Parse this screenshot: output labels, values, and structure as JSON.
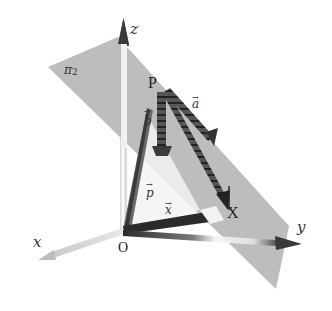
{
  "figure": {
    "type": "3d-vector-diagram",
    "axes": {
      "x": {
        "label": "x"
      },
      "y": {
        "label": "y"
      },
      "z": {
        "label": "z"
      }
    },
    "plane": {
      "label": "π",
      "subscript": "2",
      "color": "#b9b9b9"
    },
    "points": {
      "origin": {
        "label": "O"
      },
      "P": {
        "label": "P"
      },
      "X": {
        "label": "X"
      }
    },
    "vectors": {
      "a": {
        "label": "a",
        "arrow": "→",
        "style": "dashed-3d"
      },
      "b": {
        "label": "b",
        "arrow": "→",
        "style": "dashed-3d"
      },
      "p": {
        "label": "p",
        "arrow": "→",
        "style": "solid"
      },
      "x": {
        "label": "x",
        "arrow": "→",
        "style": "solid"
      }
    },
    "colors": {
      "background": "#ffffff",
      "plane": "#b9b9b9",
      "axis_light": "#d8d8d8",
      "axis_dark": "#3a3a3a",
      "vector_dark": "#2a2a2a",
      "text": "#222222"
    }
  }
}
